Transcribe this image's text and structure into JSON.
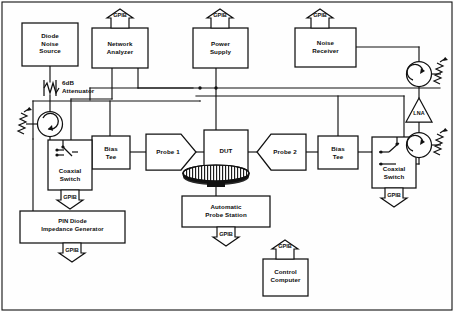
{
  "diagram": {
    "bus_label": "GPIB",
    "line_color": "#111111",
    "background": "#ffffff",
    "instruments": [
      {
        "id": "diode-noise-source",
        "label": "Diode\nNoise\nSource",
        "gpib": false
      },
      {
        "id": "network-analyzer",
        "label": "Network\nAnalyzer",
        "gpib": true
      },
      {
        "id": "power-supply",
        "label": "Power\nSupply",
        "gpib": true
      },
      {
        "id": "noise-receiver",
        "label": "Noise\nReceiver",
        "gpib": true
      },
      {
        "id": "bias-tee-1",
        "label": "Bias\nTee",
        "gpib": false
      },
      {
        "id": "bias-tee-2",
        "label": "Bias\nTee",
        "gpib": false
      },
      {
        "id": "probe-1",
        "label": "Probe 1",
        "gpib": false
      },
      {
        "id": "probe-2",
        "label": "Probe 2",
        "gpib": false
      },
      {
        "id": "dut",
        "label": "DUT",
        "gpib": false
      },
      {
        "id": "coaxial-switch-1",
        "label": "Coaxial\nSwitch",
        "gpib": true
      },
      {
        "id": "coaxial-switch-2",
        "label": "Coaxial\nSwitch",
        "gpib": true
      },
      {
        "id": "pin-diode-impedance-generator",
        "label": "PIN Diode\nImpedance Generator",
        "gpib": true
      },
      {
        "id": "automatic-probe-station",
        "label": "Automatic\nProbe Station",
        "gpib": true
      },
      {
        "id": "control-computer",
        "label": "Control\nComputer",
        "gpib": true
      },
      {
        "id": "lna",
        "label": "LNA",
        "gpib": false
      },
      {
        "id": "attenuator",
        "label": "6dB\nAttenuator",
        "gpib": false
      }
    ],
    "labels": {
      "diode_noise_source": "Diode\nNoise\nSource",
      "attenuator": "6dB\nAttenuator",
      "network_analyzer": "Network\nAnalyzer",
      "power_supply": "Power\nSupply",
      "noise_receiver": "Noise\nReceiver",
      "bias_tee_1": "Bias\nTee",
      "bias_tee_2": "Bias\nTee",
      "probe_1": "Probe 1",
      "probe_2": "Probe 2",
      "dut": "DUT",
      "coaxial_switch_1": "Coaxial\nSwitch",
      "coaxial_switch_2": "Coaxial\nSwitch",
      "pin_diode_generator": "PIN Diode\nImpedance Generator",
      "automatic_probe_station": "Automatic\nProbe Station",
      "control_computer": "Control\nComputer",
      "lna": "LNA",
      "gpib_network_analyzer": "GPIB",
      "gpib_power_supply": "GPIB",
      "gpib_noise_receiver": "GPIB",
      "gpib_coaxial_switch_1": "GPIB",
      "gpib_coaxial_switch_2": "GPIB",
      "gpib_pin_diode_generator": "GPIB",
      "gpib_probe_station": "GPIB",
      "gpib_control_computer": "GPIB"
    },
    "symbols": [
      {
        "id": "circulator-input",
        "type": "circulator"
      },
      {
        "id": "circulator-upper-right",
        "type": "circulator"
      },
      {
        "id": "circulator-lower-right",
        "type": "circulator"
      },
      {
        "id": "termination-input",
        "type": "matched-load"
      },
      {
        "id": "termination-upper-right",
        "type": "matched-load"
      },
      {
        "id": "termination-lower-right",
        "type": "matched-load"
      },
      {
        "id": "attenuator-symbol",
        "type": "resistive-attenuator"
      },
      {
        "id": "wafer-chuck",
        "type": "chuck"
      }
    ]
  }
}
